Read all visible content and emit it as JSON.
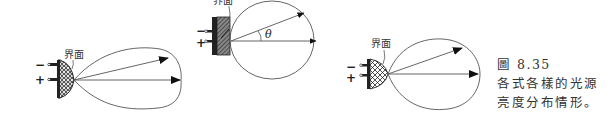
{
  "figure": {
    "number_label": "圖 8.35",
    "caption_lines": [
      "各式各樣的光源",
      "亮度分布情形。"
    ]
  },
  "diagrams": [
    {
      "name": "hemispherical-source-elongated-lobe",
      "interface_label": "界面",
      "minus_label": "−",
      "plus_label": "+"
    },
    {
      "name": "flat-source-circular-distribution",
      "interface_label": "界面",
      "minus_label": "−",
      "plus_label": "+",
      "angle_label": "θ"
    },
    {
      "name": "lens-source-ellipse-distribution",
      "interface_label": "界面",
      "minus_label": "−",
      "plus_label": "+"
    }
  ],
  "colors": {
    "line": "#555555",
    "text": "#333333",
    "fill_dark": "#222222"
  }
}
